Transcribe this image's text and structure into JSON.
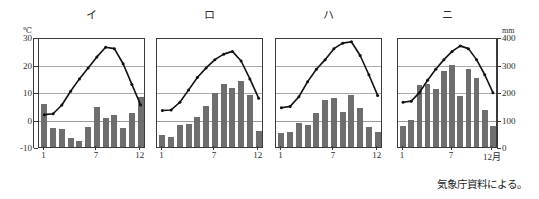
{
  "figure": {
    "caption": "気象庁資料による。",
    "left_axis": {
      "unit": "℃",
      "ticks": [
        "30",
        "20",
        "10",
        "0",
        "-10"
      ],
      "values": [
        30,
        20,
        10,
        0,
        -10
      ],
      "range": [
        -10,
        30
      ]
    },
    "right_axis": {
      "unit": "mm",
      "ticks": [
        "400",
        "300",
        "200",
        "100",
        "0"
      ],
      "values": [
        400,
        300,
        200,
        100,
        0
      ],
      "range": [
        0,
        400
      ]
    },
    "x_tick_labels": [
      "1",
      "7",
      "12"
    ],
    "x_tick_labels_last": [
      "1",
      "7",
      "12月"
    ],
    "colors": {
      "bar": "#6e6e6e",
      "line": "#111111",
      "grid": "#aaaaaa",
      "axis": "#3a3a3a",
      "background": "#ffffff"
    }
  },
  "chart_data": [
    {
      "type": "bar",
      "title": "イ",
      "xlabel": "",
      "ylabel": "",
      "categories": [
        "1",
        "2",
        "3",
        "4",
        "5",
        "6",
        "7",
        "8",
        "9",
        "10",
        "11",
        "12"
      ],
      "ylim": [
        0,
        400
      ],
      "y2lim": [
        -10,
        30
      ],
      "grid": true,
      "legend": "none",
      "series": [
        {
          "name": "降水量 (mm)",
          "type": "bar",
          "axis": "right",
          "values": [
            156,
            70,
            64,
            33,
            23,
            71,
            145,
            106,
            118,
            70,
            124,
            183
          ]
        },
        {
          "name": "気温 (℃)",
          "type": "line",
          "axis": "left",
          "values": [
            2.5,
            2.8,
            6.0,
            11.0,
            15.5,
            19.5,
            23.5,
            27.0,
            26.5,
            21.0,
            13.5,
            6.0
          ]
        }
      ]
    },
    {
      "type": "bar",
      "title": "ロ",
      "xlabel": "",
      "ylabel": "",
      "categories": [
        "1",
        "2",
        "3",
        "4",
        "5",
        "6",
        "7",
        "8",
        "9",
        "10",
        "11",
        "12"
      ],
      "ylim": [
        0,
        400
      ],
      "y2lim": [
        -10,
        30
      ],
      "grid": true,
      "legend": "none",
      "series": [
        {
          "name": "降水量 (mm)",
          "type": "bar",
          "axis": "right",
          "values": [
            45,
            36,
            80,
            85,
            108,
            148,
            196,
            230,
            213,
            240,
            190,
            58
          ]
        },
        {
          "name": "気温 (℃)",
          "type": "line",
          "axis": "left",
          "values": [
            4.0,
            4.2,
            7.0,
            11.5,
            16.0,
            19.5,
            22.5,
            24.5,
            25.5,
            22.0,
            15.5,
            8.5
          ]
        }
      ]
    },
    {
      "type": "bar",
      "title": "ハ",
      "xlabel": "",
      "ylabel": "",
      "categories": [
        "1",
        "2",
        "3",
        "4",
        "5",
        "6",
        "7",
        "8",
        "9",
        "10",
        "11",
        "12"
      ],
      "ylim": [
        0,
        400
      ],
      "y2lim": [
        -10,
        30
      ],
      "grid": true,
      "legend": "none",
      "series": [
        {
          "name": "降水量 (mm)",
          "type": "bar",
          "axis": "right",
          "values": [
            50,
            55,
            88,
            80,
            125,
            170,
            178,
            128,
            190,
            143,
            72,
            55
          ]
        },
        {
          "name": "気温 (℃)",
          "type": "line",
          "axis": "left",
          "values": [
            5.0,
            5.5,
            9.0,
            14.5,
            19.0,
            22.5,
            26.5,
            28.5,
            29.0,
            24.0,
            17.0,
            9.5
          ]
        }
      ]
    },
    {
      "type": "bar",
      "title": "ニ",
      "xlabel": "",
      "ylabel": "",
      "categories": [
        "1",
        "2",
        "3",
        "4",
        "5",
        "6",
        "7",
        "8",
        "9",
        "10",
        "11",
        "12"
      ],
      "ylim": [
        0,
        400
      ],
      "y2lim": [
        -10,
        30
      ],
      "grid": true,
      "legend": "none",
      "series": [
        {
          "name": "降水量 (mm)",
          "type": "bar",
          "axis": "right",
          "values": [
            75,
            100,
            225,
            230,
            212,
            275,
            298,
            185,
            285,
            252,
            133,
            78
          ]
        },
        {
          "name": "気温 (℃)",
          "type": "line",
          "axis": "left",
          "values": [
            7.0,
            7.4,
            10.5,
            15.0,
            19.0,
            22.5,
            25.5,
            27.5,
            26.5,
            22.5,
            17.0,
            10.5
          ]
        }
      ]
    }
  ],
  "panels_geometry": [
    {
      "left": 38,
      "width": 107
    },
    {
      "left": 156,
      "width": 107
    },
    {
      "left": 275,
      "width": 107
    },
    {
      "left": 397,
      "width": 100
    }
  ]
}
